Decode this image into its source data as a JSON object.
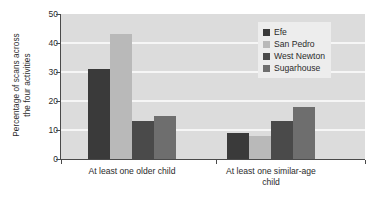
{
  "chart_data": {
    "type": "bar",
    "title": "",
    "xlabel": "",
    "ylabel_line1": "Percentage of scans across",
    "ylabel_line2": "the four activities",
    "ylim": [
      0,
      50
    ],
    "yticks": [
      0,
      10,
      20,
      30,
      40,
      50
    ],
    "ytick_labels": [
      "0",
      "10",
      "20",
      "30",
      "40",
      "50"
    ],
    "grid": "horizontal",
    "legend_position": "upper right",
    "categories": [
      "At least one older child",
      "At least one similar-age child"
    ],
    "category_label_lines": [
      [
        "At least one older child"
      ],
      [
        "At least one similar-age",
        "child"
      ]
    ],
    "series": [
      {
        "name": "Efe",
        "color": "#3a3a3a",
        "values": [
          31,
          9
        ]
      },
      {
        "name": "San Pedro",
        "color": "#b9b9b9",
        "values": [
          43,
          8
        ]
      },
      {
        "name": "West Newton",
        "color": "#4a4a4a",
        "values": [
          13,
          13
        ]
      },
      {
        "name": "Sugarhouse",
        "color": "#6e6e6e",
        "values": [
          15,
          18
        ]
      }
    ],
    "plot_background": "#dcdcdc",
    "gridline_color": "#f6f6f6",
    "axis_color": "#4a4a4a",
    "figure_background": "#ffffff"
  },
  "legend": {
    "items": [
      {
        "label": "Efe"
      },
      {
        "label": "San Pedro"
      },
      {
        "label": "West Newton"
      },
      {
        "label": "Sugarhouse"
      }
    ]
  }
}
